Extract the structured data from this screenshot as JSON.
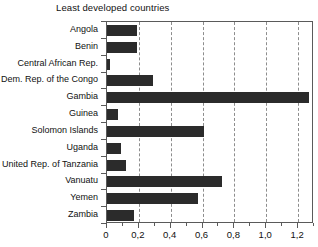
{
  "chart_data": {
    "type": "bar",
    "orientation": "horizontal",
    "title": "Least developed countries",
    "xlabel": "",
    "ylabel": "",
    "xlim": [
      0,
      1.3
    ],
    "grid": true,
    "legend": null,
    "xticks": [
      "0",
      "0,2",
      "0,4",
      "0,6",
      "0,8",
      "1,0",
      "1,2"
    ],
    "xtick_values": [
      0,
      0.2,
      0.4,
      0.6,
      0.8,
      1.0,
      1.2
    ],
    "categories": [
      "Angola",
      "Benin",
      "Central African Rep.",
      "Dem. Rep. of the Congo",
      "Gambia",
      "Guinea",
      "Solomon Islands",
      "Uganda",
      "United Rep. of Tanzania",
      "Vanuatu",
      "Yemen",
      "Zambia"
    ],
    "values": [
      0.19,
      0.19,
      0.02,
      0.29,
      1.27,
      0.07,
      0.61,
      0.09,
      0.12,
      0.72,
      0.57,
      0.17
    ],
    "bar_color": "#2b2b2b"
  }
}
